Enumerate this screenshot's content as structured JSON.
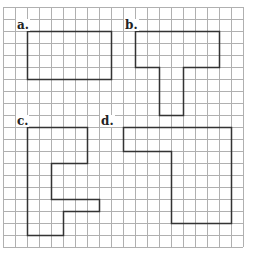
{
  "diagram": {
    "grid": {
      "cols": 20,
      "rows": 20,
      "cell_px": 12,
      "origin": [
        3,
        7
      ],
      "line_color": "#b0b0b0"
    },
    "shape_color": "#333333",
    "shapes": [
      {
        "label": "a.",
        "points": [
          [
            2,
            2
          ],
          [
            9,
            2
          ],
          [
            9,
            6
          ],
          [
            2,
            6
          ]
        ],
        "label_pos": [
          1,
          1
        ]
      },
      {
        "label": "b.",
        "points": [
          [
            11,
            2
          ],
          [
            18,
            2
          ],
          [
            18,
            5
          ],
          [
            15,
            5
          ],
          [
            15,
            9
          ],
          [
            13,
            9
          ],
          [
            13,
            5
          ],
          [
            11,
            5
          ]
        ],
        "label_pos": [
          10,
          1
        ]
      },
      {
        "label": "c.",
        "points": [
          [
            2,
            10
          ],
          [
            7,
            10
          ],
          [
            7,
            13
          ],
          [
            4,
            13
          ],
          [
            4,
            16
          ],
          [
            8,
            16
          ],
          [
            8,
            17
          ],
          [
            5,
            17
          ],
          [
            5,
            19
          ],
          [
            2,
            19
          ]
        ],
        "label_pos": [
          1,
          9
        ]
      },
      {
        "label": "d.",
        "points": [
          [
            10,
            10
          ],
          [
            19,
            10
          ],
          [
            19,
            18
          ],
          [
            14,
            18
          ],
          [
            14,
            12
          ],
          [
            10,
            12
          ]
        ],
        "label_pos": [
          8,
          9
        ]
      }
    ]
  }
}
